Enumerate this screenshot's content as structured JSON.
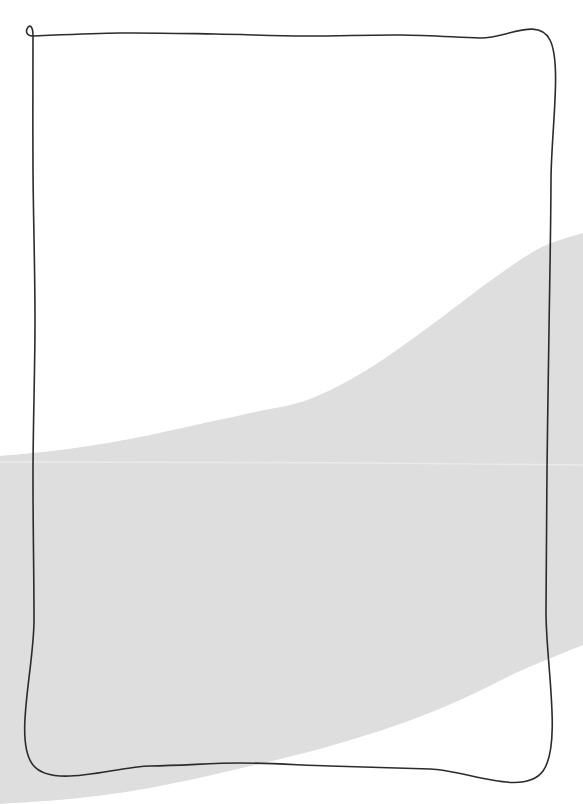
{
  "canvas": {
    "width": 583,
    "height": 804,
    "background_color": "#ffffff",
    "title": "Abstract Shape Composition"
  },
  "palette": {
    "background": "#ffffff",
    "band_fill": "#dddedd",
    "band_seam": "#e9eae9",
    "outline_stroke": "#2b2b2b"
  },
  "shapes": {
    "gray_band": {
      "name": "gray-curved-band",
      "fill": "#dddedd",
      "opacity": 1,
      "description": "Large light gray S-curved ribbon sweeping from lower-left to upper-right, exiting both the left and right edges of the canvas.",
      "top_edge_points": [
        {
          "x": 0,
          "y": 456
        },
        {
          "x": 60,
          "y": 450
        },
        {
          "x": 130,
          "y": 439
        },
        {
          "x": 200,
          "y": 424
        },
        {
          "x": 255,
          "y": 412
        },
        {
          "x": 310,
          "y": 399
        },
        {
          "x": 370,
          "y": 368
        },
        {
          "x": 430,
          "y": 326
        },
        {
          "x": 490,
          "y": 281
        },
        {
          "x": 540,
          "y": 248
        },
        {
          "x": 583,
          "y": 233
        }
      ],
      "bottom_edge_points": [
        {
          "x": 0,
          "y": 804
        },
        {
          "x": 80,
          "y": 798
        },
        {
          "x": 160,
          "y": 786
        },
        {
          "x": 255,
          "y": 765
        },
        {
          "x": 330,
          "y": 746
        },
        {
          "x": 400,
          "y": 724
        },
        {
          "x": 460,
          "y": 700
        },
        {
          "x": 520,
          "y": 671
        },
        {
          "x": 583,
          "y": 645
        }
      ],
      "seam_line_y": 462,
      "seam_line_color": "#e9eae9"
    },
    "hand_drawn_rectangle": {
      "name": "hand-drawn-rectangle-outline",
      "stroke": "#2b2b2b",
      "stroke_width": 1.6,
      "fill": "none",
      "description": "Slightly irregular hand-drawn rectangle border framing the upper portion of the canvas.",
      "corners": {
        "top_left": {
          "x": 33,
          "y": 34
        },
        "top_right": {
          "x": 550,
          "y": 40
        },
        "bottom_right": {
          "x": 543,
          "y": 771
        },
        "bottom_left": {
          "x": 33,
          "y": 765
        }
      },
      "path_points": [
        {
          "x": 33,
          "y": 36
        },
        {
          "x": 120,
          "y": 33
        },
        {
          "x": 215,
          "y": 34
        },
        {
          "x": 305,
          "y": 36
        },
        {
          "x": 400,
          "y": 35
        },
        {
          "x": 480,
          "y": 38
        },
        {
          "x": 550,
          "y": 40
        },
        {
          "x": 551,
          "y": 180
        },
        {
          "x": 549,
          "y": 330
        },
        {
          "x": 547,
          "y": 470
        },
        {
          "x": 546,
          "y": 610
        },
        {
          "x": 543,
          "y": 771
        },
        {
          "x": 430,
          "y": 769
        },
        {
          "x": 330,
          "y": 766
        },
        {
          "x": 240,
          "y": 763
        },
        {
          "x": 150,
          "y": 766
        },
        {
          "x": 33,
          "y": 765
        },
        {
          "x": 34,
          "y": 620
        },
        {
          "x": 33,
          "y": 470
        },
        {
          "x": 35,
          "y": 320
        },
        {
          "x": 33,
          "y": 170
        },
        {
          "x": 33,
          "y": 36
        }
      ]
    }
  }
}
